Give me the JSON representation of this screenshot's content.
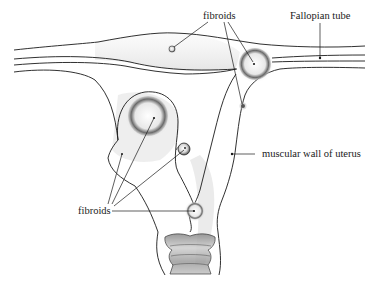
{
  "diagram": {
    "type": "anatomical illustration",
    "labels": {
      "fibroids_top": "fibroids",
      "fallopian_tube": "Fallopian tube",
      "muscular_wall": "muscular wall of uterus",
      "fibroids_left": "fibroids"
    },
    "colors": {
      "ink": "#1a1a1a",
      "background": "#ffffff",
      "stipple": "#555555"
    }
  }
}
